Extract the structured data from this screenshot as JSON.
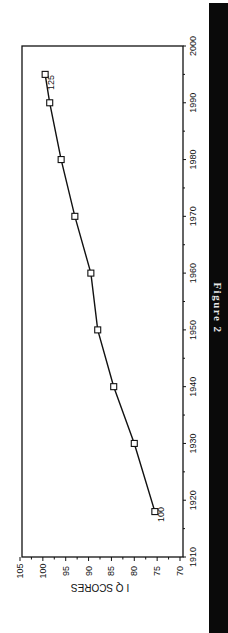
{
  "chart_data": {
    "type": "line",
    "title": "",
    "caption": "Figure 2",
    "xlabel": "",
    "ylabel": "I Q SCORES",
    "orientation": "rotated 90deg clockwise",
    "x": [
      1918,
      1930,
      1940,
      1950,
      1960,
      1970,
      1980,
      1990,
      1995
    ],
    "series": [
      {
        "name": "IQ scores",
        "values": [
          75.5,
          80,
          84.5,
          88,
          89.5,
          93,
          96,
          98.5,
          99.5
        ],
        "marker": "open-square"
      }
    ],
    "xlim": [
      1910,
      2000
    ],
    "ylim": [
      70,
      105
    ],
    "x_ticks": [
      "1910",
      "1920",
      "1930",
      "1940",
      "1950",
      "1960",
      "1970",
      "1980",
      "1990",
      "2000"
    ],
    "y_ticks": [
      "105",
      "100",
      "95",
      "90",
      "85",
      "80",
      "75",
      "70"
    ],
    "annotations": [
      {
        "text": "100",
        "at_x": 1918
      },
      {
        "text": "125",
        "at_x": 1995
      }
    ],
    "grid": false,
    "legend": false
  },
  "figure": {
    "label": "Figure 2"
  }
}
